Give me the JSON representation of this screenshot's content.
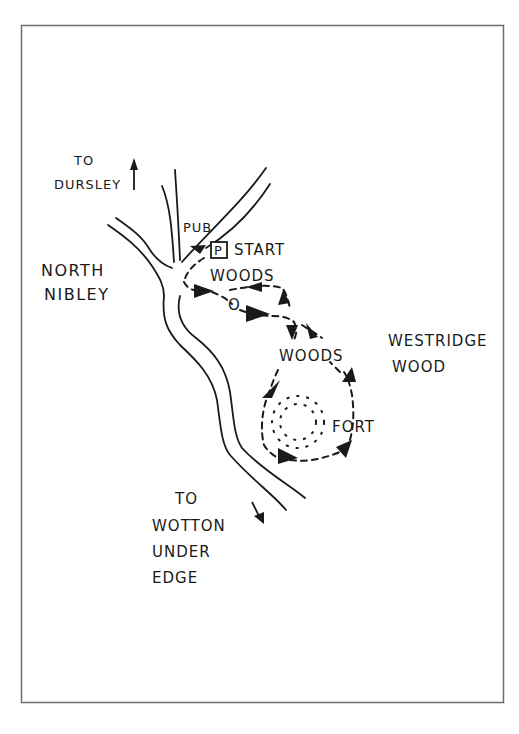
{
  "map": {
    "title": "North Nibley walk route",
    "colors": {
      "ink": "#1a1a1a",
      "paper": "#ffffff",
      "border": "#6e6e6e"
    },
    "places": {
      "dursley_to": "TO",
      "dursley": "DURSLEY",
      "pub": "PUB",
      "parking": "P",
      "start": "START",
      "woods_top": "WOODS",
      "north": "NORTH",
      "nibley": "NIBLEY",
      "landmark_o": "O",
      "woods_middle": "WOODS",
      "westridge": "WESTRIDGE",
      "wood": "WOOD",
      "fort": "FORT",
      "wotton_to": "TO",
      "wotton": "WOTTON",
      "under": "UNDER",
      "edge": "EDGE"
    },
    "directions": [
      {
        "label": "TO DURSLEY",
        "icon": "arrow-up-icon"
      },
      {
        "label": "TO WOTTON UNDER EDGE",
        "icon": "arrow-down-icon"
      }
    ],
    "symbols": [
      {
        "name": "parking-icon",
        "glyph": "P"
      },
      {
        "name": "hillfort-icon",
        "description": "dashed circle"
      },
      {
        "name": "route-arrow-icon",
        "description": "solid triangular arrowhead"
      }
    ]
  }
}
